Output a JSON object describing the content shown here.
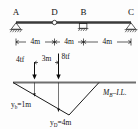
{
  "figure": {
    "beam": {
      "nodes": [
        {
          "id": "A",
          "label": "A",
          "support": "pin"
        },
        {
          "id": "D",
          "label": "D",
          "support": "hinge"
        },
        {
          "id": "B",
          "label": "B",
          "support": "roller"
        },
        {
          "id": "C",
          "label": "C",
          "support": "pin"
        }
      ],
      "spans": [
        {
          "label": "4m",
          "value": 4,
          "unit": "m",
          "from": "A",
          "to": "D"
        },
        {
          "label": "4m",
          "value": 4,
          "unit": "m",
          "from": "D",
          "to": "B"
        },
        {
          "label": "4m",
          "value": 4,
          "unit": "m",
          "from": "B",
          "to": "C"
        }
      ]
    },
    "loads": [
      {
        "label": "4tf",
        "value": 4,
        "unit": "tf",
        "direction": "down"
      },
      {
        "label": "8tf",
        "value": 8,
        "unit": "tf",
        "direction": "down"
      }
    ],
    "load_spacing": {
      "label": "3m",
      "value": 3,
      "unit": "m"
    },
    "influence_line": {
      "name": "M_B-I.L.",
      "name_main": "M",
      "name_sub": "B",
      "name_tail": "–I.L.",
      "ordinates": [
        {
          "label": "y_b=1m",
          "symbol": "y",
          "subscript": "b",
          "equals": "=1m",
          "value": 1,
          "unit": "m"
        },
        {
          "label": "y_D=4m",
          "symbol": "y",
          "subscript": "D",
          "equals": "=4m",
          "value": 4,
          "unit": "m"
        }
      ]
    },
    "colors": {
      "ink": "#111111",
      "beam": "#3a3a3a",
      "axis": "#6f6f6f",
      "background": "#fdfdfd"
    }
  }
}
